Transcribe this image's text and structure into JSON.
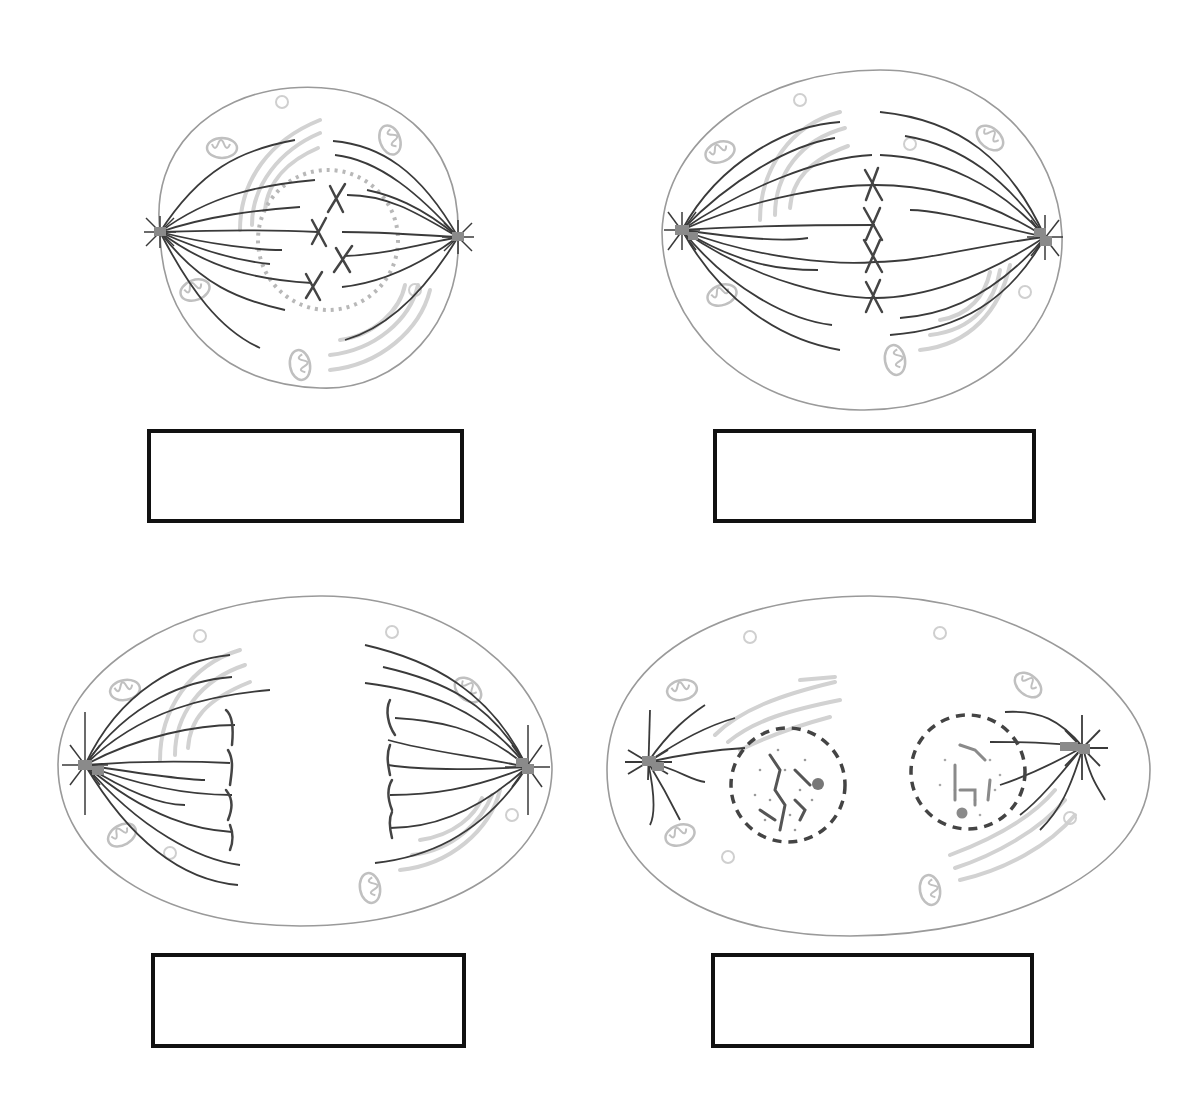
{
  "worksheet": {
    "colors": {
      "cell_outline": "#9a9a9a",
      "spindle": "#3a3a3a",
      "centrosome": "#8a8a8a",
      "organelle": "#c8c8c8",
      "chromosome": "#444444",
      "nuclear_envelope_dotted": "#b0b0b0",
      "nuclear_envelope_dashed": "#444444",
      "label_border": "#111111"
    },
    "cells": [
      {
        "id": "cell-1",
        "stage_depicted": "prometaphase",
        "outline": "M160 232 C 150 150, 210 95, 300 88 C 400 82, 460 140, 458 237 C 460 320, 400 392, 320 388 C 230 385, 165 330, 160 232 Z",
        "poles": [
          [
            160,
            232
          ],
          [
            458,
            237
          ]
        ],
        "label_box": {
          "x": 147,
          "y": 429,
          "w": 317,
          "h": 94,
          "text": ""
        }
      },
      {
        "id": "cell-2",
        "stage_depicted": "metaphase",
        "outline": "M672 232 C 670 140, 760 72, 880 72 C 990 72, 1050 150, 1058 235 C 1062 330, 980 412, 860 410 C 740 408, 672 320, 672 232 Z",
        "poles": [
          [
            682,
            230
          ],
          [
            1045,
            237
          ]
        ],
        "label_box": {
          "x": 713,
          "y": 429,
          "w": 323,
          "h": 94,
          "text": ""
        }
      },
      {
        "id": "cell-3",
        "stage_depicted": "anaphase",
        "outline": "M60 765 C 60 670, 180 598, 320 597 C 450 596, 550 680, 550 770 C 548 860, 450 925, 300 925 C 160 925, 60 860, 60 765 Z",
        "poles": [
          [
            85,
            765
          ],
          [
            527,
            767
          ]
        ],
        "label_box": {
          "x": 151,
          "y": 953,
          "w": 315,
          "h": 95,
          "text": ""
        }
      },
      {
        "id": "cell-4",
        "stage_depicted": "telophase",
        "outline": "M610 770 C 610 660, 720 597, 870 597 C 1010 597, 1150 680, 1150 770 C 1150 870, 1010 935, 850 935 C 700 935, 610 870, 610 770 Z",
        "poles": [
          [
            648,
            762
          ],
          [
            1083,
            747
          ]
        ],
        "nuclei": [
          [
            788,
            785,
            58
          ],
          [
            968,
            770,
            58
          ]
        ],
        "label_box": {
          "x": 711,
          "y": 953,
          "w": 323,
          "h": 95,
          "text": ""
        }
      }
    ]
  }
}
